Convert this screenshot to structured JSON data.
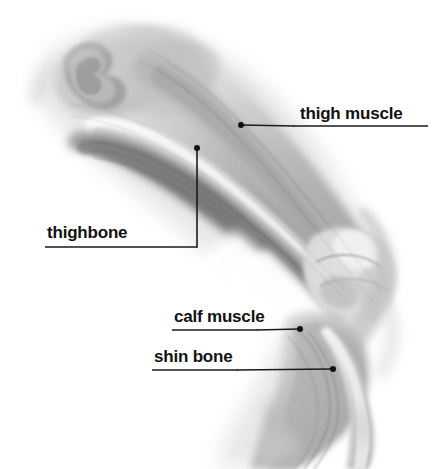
{
  "figure": {
    "kind": "anatomical-illustration",
    "background_color": "#ffffff",
    "ink_color": "#111111",
    "line_color": "#1a1a1a"
  },
  "labels": [
    {
      "id": "thigh-muscle",
      "text": "thigh muscle",
      "text_x": 300,
      "text_y": 105,
      "underline": {
        "x1": 293,
        "y1": 126,
        "x2": 428,
        "y2": 126
      },
      "leader": {
        "x1": 241,
        "y1": 125,
        "x2": 293,
        "y2": 126
      },
      "dot": {
        "cx": 241,
        "cy": 125,
        "r": 3
      }
    },
    {
      "id": "thighbone",
      "text": "thighbone",
      "text_x": 47,
      "text_y": 224,
      "underline": {
        "x1": 45,
        "y1": 247,
        "x2": 197,
        "y2": 247
      },
      "leader": {
        "x1": 197,
        "y1": 247,
        "x2": 197,
        "y2": 150
      },
      "dot": {
        "cx": 197,
        "cy": 148,
        "r": 3
      }
    },
    {
      "id": "calf-muscle",
      "text": "calf muscle",
      "text_x": 174,
      "text_y": 308,
      "underline": {
        "x1": 172,
        "y1": 330,
        "x2": 258,
        "y2": 330
      },
      "leader": {
        "x1": 258,
        "y1": 330,
        "x2": 299,
        "y2": 329
      },
      "dot": {
        "cx": 300,
        "cy": 329,
        "r": 3
      }
    },
    {
      "id": "shin-bone",
      "text": "shin bone",
      "text_x": 154,
      "text_y": 348,
      "underline": {
        "x1": 152,
        "y1": 370,
        "x2": 238,
        "y2": 370
      },
      "leader": {
        "x1": 238,
        "y1": 370,
        "x2": 332,
        "y2": 369
      },
      "dot": {
        "cx": 333,
        "cy": 369,
        "r": 3
      }
    }
  ]
}
